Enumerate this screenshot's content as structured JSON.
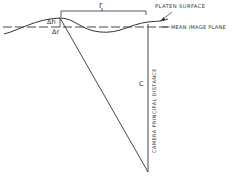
{
  "diagram": {
    "labels": {
      "r": "r",
      "platen_surface": "PLATEN SURFACE",
      "mean_image_plane": "MEAN IMAGE PLANE",
      "delta_h": "Δh",
      "delta_r": "Δr",
      "c": "C",
      "camera_principal_distance": "CAMERA PRINCIPAL DISTANCE"
    },
    "colors": {
      "line": "#333333",
      "background": "#ffffff"
    }
  }
}
